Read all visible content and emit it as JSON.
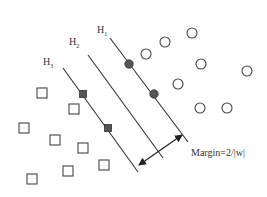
{
  "diagram": {
    "type": "svm-margin",
    "hyperplanes": [
      {
        "label": "H",
        "sub": "1",
        "x1": 110,
        "y1": 38,
        "x2": 188,
        "y2": 142,
        "lx": 97,
        "ly": 24
      },
      {
        "label": "H",
        "sub": "2",
        "x1": 88,
        "y1": 55,
        "x2": 163,
        "y2": 158,
        "lx": 69,
        "ly": 36
      },
      {
        "label": "H",
        "sub": "3",
        "x1": 63,
        "y1": 68,
        "x2": 138,
        "y2": 172,
        "lx": 43,
        "ly": 56
      }
    ],
    "margin_label": "Margin=2/|w|",
    "margin_arrow": {
      "x1": 139,
      "y1": 165,
      "x2": 182,
      "y2": 135
    },
    "class_circles": [
      {
        "x": 192,
        "y": 33
      },
      {
        "x": 165,
        "y": 42
      },
      {
        "x": 146,
        "y": 54
      },
      {
        "x": 201,
        "y": 64
      },
      {
        "x": 247,
        "y": 71
      },
      {
        "x": 178,
        "y": 84
      },
      {
        "x": 200,
        "y": 108
      },
      {
        "x": 227,
        "y": 108
      }
    ],
    "support_circles": [
      {
        "x": 129,
        "y": 64
      },
      {
        "x": 154,
        "y": 94
      }
    ],
    "class_squares": [
      {
        "x": 42,
        "y": 93
      },
      {
        "x": 74,
        "y": 109
      },
      {
        "x": 24,
        "y": 128
      },
      {
        "x": 55,
        "y": 140
      },
      {
        "x": 83,
        "y": 148
      },
      {
        "x": 104,
        "y": 165
      },
      {
        "x": 68,
        "y": 171
      },
      {
        "x": 32,
        "y": 179
      }
    ],
    "support_squares": [
      {
        "x": 83,
        "y": 94
      },
      {
        "x": 108,
        "y": 128
      }
    ],
    "colors": {
      "stroke": "#333333",
      "fill_support": "#555555"
    }
  }
}
